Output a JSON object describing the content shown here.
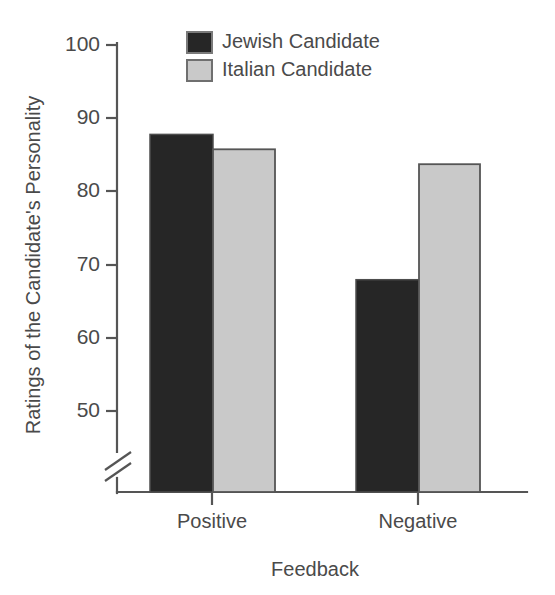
{
  "chart_data": {
    "type": "bar",
    "title": "",
    "xlabel": "Feedback",
    "ylabel": "Ratings of the Candidate's Personality",
    "categories": [
      "Positive",
      "Negative"
    ],
    "series": [
      {
        "name": "Jewish Candidate",
        "values": [
          88,
          68.5
        ],
        "color": "#262626"
      },
      {
        "name": "Italian Candidate",
        "values": [
          86,
          84
        ],
        "color": "#c9c9c9"
      }
    ],
    "ylim": [
      45,
      100
    ],
    "yticks": [
      50,
      60,
      70,
      80,
      90,
      100
    ],
    "ytick_labels": [
      "50",
      "60",
      "70",
      "80",
      "90",
      "100"
    ],
    "axis_break": true,
    "axis_break_note": "broken y-axis below 50",
    "grid": false,
    "legend_position": "top-center",
    "bar_edge_color": "#555555",
    "axis_color": "#555555"
  },
  "legend": {
    "entries": [
      {
        "label": "Jewish Candidate",
        "swatch": "dark-swatch"
      },
      {
        "label": "Italian Candidate",
        "swatch": "light-swatch"
      }
    ]
  },
  "axes": {
    "y_tick_labels": [
      "100",
      "90",
      "80",
      "70",
      "60",
      "50"
    ],
    "x_tick_labels": [
      "Positive",
      "Negative"
    ],
    "x_title": "Feedback",
    "y_title": "Ratings of the Candidate's Personality"
  }
}
